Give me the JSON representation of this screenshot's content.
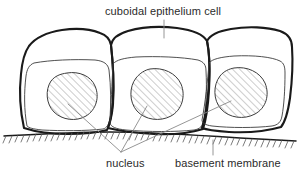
{
  "diagram": {
    "title_label": "cuboidal epithelium cell",
    "nucleus_label": "nucleus",
    "basement_membrane_label": "basement membrane",
    "colors": {
      "background": "#ffffff",
      "cell_outline": "#1a1a1a",
      "inner_contour": "#3c3c3c",
      "nucleus_outline": "#3c3c3c",
      "hatch": "#6e6e6e",
      "membrane_line": "#1a1a1a",
      "membrane_hatch": "#5a5a5a",
      "leader_line": "#8a8a8a",
      "text": "#2b2b2b"
    },
    "structure": {
      "cell_count": 3,
      "nucleus_count": 3,
      "nucleus_fill": "diagonal-hatch",
      "basement_membrane_fill": "diagonal-hatch-ticks"
    }
  }
}
